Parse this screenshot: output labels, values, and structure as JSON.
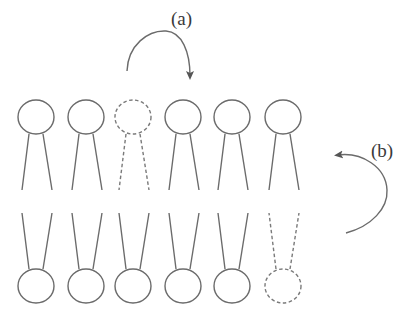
{
  "diagram": {
    "type": "lipid-bilayer-flip-flop",
    "labels": {
      "a": "(a)",
      "b": "(b)"
    },
    "colors": {
      "line": "#6b6b6b",
      "dashed_line": "#7a7a7a",
      "text": "#3a3a3a",
      "background": "#ffffff"
    },
    "upper_leaflet": {
      "head_center_y": 117,
      "head_rx": 18,
      "head_ry": 17,
      "tail_top_y": 134,
      "tail_bottom_y": 190,
      "lipids": [
        {
          "x": 36,
          "style": "solid"
        },
        {
          "x": 86,
          "style": "solid"
        },
        {
          "x": 133,
          "style": "dashed"
        },
        {
          "x": 183,
          "style": "solid"
        },
        {
          "x": 232,
          "style": "solid"
        },
        {
          "x": 283,
          "style": "solid"
        }
      ]
    },
    "lower_leaflet": {
      "head_center_y": 286,
      "head_rx": 18,
      "head_ry": 17,
      "tail_top_y": 213,
      "tail_bottom_y": 269,
      "lipids": [
        {
          "x": 36,
          "style": "solid"
        },
        {
          "x": 86,
          "style": "solid"
        },
        {
          "x": 133,
          "style": "solid"
        },
        {
          "x": 183,
          "style": "solid"
        },
        {
          "x": 232,
          "style": "solid"
        },
        {
          "x": 283,
          "style": "dashed"
        }
      ]
    },
    "arrows": [
      {
        "id": "a",
        "description": "lateral diffusion arrow over upper leaflet, from dashed lipid position to the right"
      },
      {
        "id": "b",
        "description": "flip-flop arrow on right side, from lower leaflet to upper leaflet"
      }
    ]
  }
}
